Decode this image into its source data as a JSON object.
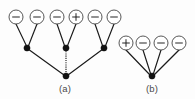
{
  "figure": {
    "background_color": "#fdfdfd",
    "node_color": "#111111",
    "edge_color": "#1a1a1a",
    "leaf_fill": "#ffffff",
    "leaf_stroke": "#3a3a3a",
    "caption_color": "#4a4a4a",
    "panels": [
      {
        "id": "panel-a",
        "caption": "(a)",
        "caption_x": 65,
        "caption_y": 92,
        "leaves": [
          {
            "id": "a-leaf-1",
            "sign": "−",
            "cx": 16,
            "cy": 17,
            "r": 7.0
          },
          {
            "id": "a-leaf-2",
            "sign": "−",
            "cx": 37,
            "cy": 17,
            "r": 7.0
          },
          {
            "id": "a-leaf-3",
            "sign": "−",
            "cx": 57,
            "cy": 17,
            "r": 7.0
          },
          {
            "id": "a-leaf-4",
            "sign": "+",
            "cx": 76,
            "cy": 17,
            "r": 7.0
          },
          {
            "id": "a-leaf-5",
            "sign": "−",
            "cx": 95,
            "cy": 17,
            "r": 7.0
          },
          {
            "id": "a-leaf-6",
            "sign": "−",
            "cx": 114,
            "cy": 17,
            "r": 7.0
          }
        ],
        "internal_nodes": [
          {
            "id": "a-node-left",
            "cx": 27,
            "cy": 48,
            "r": 3.1
          },
          {
            "id": "a-node-middle",
            "cx": 66,
            "cy": 48,
            "r": 3.1
          },
          {
            "id": "a-node-right",
            "cx": 104,
            "cy": 48,
            "r": 3.1
          },
          {
            "id": "a-node-root",
            "cx": 66,
            "cy": 76,
            "r": 3.1
          }
        ],
        "edges": [
          {
            "id": "a-e1",
            "x1": 16,
            "y1": 24,
            "x2": 27,
            "y2": 47,
            "style": "solid"
          },
          {
            "id": "a-e2",
            "x1": 37,
            "y1": 24,
            "x2": 28,
            "y2": 47,
            "style": "solid"
          },
          {
            "id": "a-e3",
            "x1": 57,
            "y1": 24,
            "x2": 65,
            "y2": 47,
            "style": "solid"
          },
          {
            "id": "a-e4",
            "x1": 76,
            "y1": 24,
            "x2": 67,
            "y2": 47,
            "style": "solid"
          },
          {
            "id": "a-e5",
            "x1": 95,
            "y1": 24,
            "x2": 103,
            "y2": 47,
            "style": "solid"
          },
          {
            "id": "a-e6",
            "x1": 114,
            "y1": 24,
            "x2": 105,
            "y2": 47,
            "style": "solid"
          },
          {
            "id": "a-e7",
            "x1": 28,
            "y1": 49,
            "x2": 64,
            "y2": 75,
            "style": "solid"
          },
          {
            "id": "a-e8",
            "x1": 66,
            "y1": 49,
            "x2": 66,
            "y2": 75,
            "style": "dotted"
          },
          {
            "id": "a-e9",
            "x1": 103,
            "y1": 49,
            "x2": 68,
            "y2": 75,
            "style": "solid"
          }
        ]
      },
      {
        "id": "panel-b",
        "caption": "(b)",
        "caption_x": 152,
        "caption_y": 92,
        "leaves": [
          {
            "id": "b-leaf-1",
            "sign": "+",
            "cx": 126,
            "cy": 43,
            "r": 7.0
          },
          {
            "id": "b-leaf-2",
            "sign": "−",
            "cx": 143,
            "cy": 43,
            "r": 7.0
          },
          {
            "id": "b-leaf-3",
            "sign": "−",
            "cx": 161,
            "cy": 43,
            "r": 7.0
          },
          {
            "id": "b-leaf-4",
            "sign": "−",
            "cx": 179,
            "cy": 43,
            "r": 7.0
          }
        ],
        "internal_nodes": [
          {
            "id": "b-node-root",
            "cx": 152,
            "cy": 76,
            "r": 3.1
          }
        ],
        "edges": [
          {
            "id": "b-e1",
            "x1": 126,
            "y1": 50,
            "x2": 150,
            "y2": 75,
            "style": "solid"
          },
          {
            "id": "b-e2",
            "x1": 143,
            "y1": 50,
            "x2": 151,
            "y2": 75,
            "style": "solid"
          },
          {
            "id": "b-e3",
            "x1": 161,
            "y1": 50,
            "x2": 153,
            "y2": 75,
            "style": "solid"
          },
          {
            "id": "b-e4",
            "x1": 179,
            "y1": 50,
            "x2": 154,
            "y2": 75,
            "style": "solid"
          }
        ]
      }
    ]
  }
}
